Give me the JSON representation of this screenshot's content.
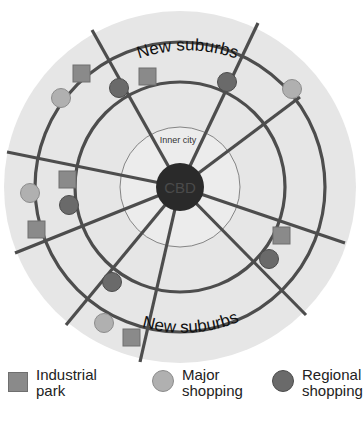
{
  "diagram": {
    "labels": {
      "cbd": "CBD",
      "inner_city": "Inner city",
      "new_suburbs_top": "New suburbs",
      "new_suburbs_bottom": "New suburbs"
    },
    "colors": {
      "background_disc": "#e6e6e6",
      "inner_city_fill": "#ececec",
      "cbd_fill": "#2a2a2a",
      "cbd_text": "#4a4a4a",
      "roads": "#4d4d4d",
      "industrial_park": "#8a8a8a",
      "major_shopping": "#b0b0b0",
      "regional_shopping": "#6a6a6a"
    },
    "counts": {
      "industrial_park": 6,
      "major_shopping": 4,
      "regional_shopping": 6
    }
  },
  "legend": {
    "items": [
      {
        "id": "industrial",
        "line1": "Industrial",
        "line2": "park",
        "symbol": "square"
      },
      {
        "id": "major",
        "line1": "Major",
        "line2": "shopping",
        "symbol": "circle-light"
      },
      {
        "id": "regional",
        "line1": "Regional",
        "line2": "shopping",
        "symbol": "circle-dark"
      }
    ]
  }
}
